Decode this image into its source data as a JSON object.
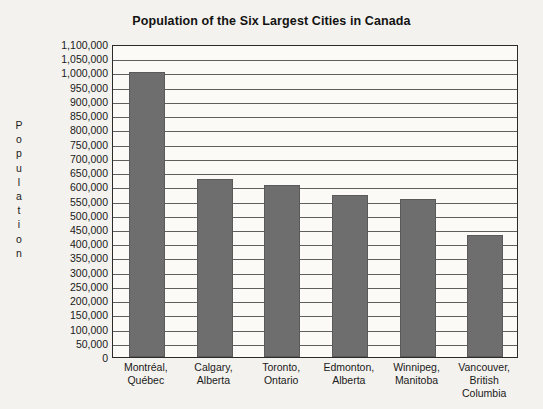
{
  "chart_data": {
    "type": "bar",
    "title": "Population of the Six Largest Cities in Canada",
    "xlabel": "",
    "ylabel": "Population",
    "ylabel_letters": [
      "P",
      "o",
      "p",
      "u",
      "l",
      "a",
      "t",
      "i",
      "o",
      "n"
    ],
    "categories": [
      "Montréal, Québec",
      "Calgary, Alberta",
      "Toronto, Ontario",
      "Edmonton, Alberta",
      "Winnipeg, Manitoba",
      "Vancouver, British Columbia"
    ],
    "category_lines": [
      [
        "Montréal,",
        "Québec"
      ],
      [
        "Calgary,",
        "Alberta"
      ],
      [
        "Toronto,",
        "Ontario"
      ],
      [
        "Edmonton,",
        "Alberta"
      ],
      [
        "Winnipeg,",
        "Manitoba"
      ],
      [
        "Vancouver,",
        "British",
        "Columbia"
      ]
    ],
    "values": [
      1000000,
      625000,
      605000,
      570000,
      555000,
      430000
    ],
    "ylim": [
      0,
      1100000
    ],
    "ytick_step": 50000,
    "ytick_labels": [
      "1,100,000",
      "1,050,000",
      "1,000,000",
      "950,000",
      "900,000",
      "850,000",
      "800,000",
      "750,000",
      "700,000",
      "650,000",
      "600,000",
      "550,000",
      "500,000",
      "450,000",
      "400,000",
      "350,000",
      "300,000",
      "250,000",
      "200,000",
      "150,000",
      "100,000",
      "50,000",
      "0"
    ],
    "ytick_values": [
      1100000,
      1050000,
      1000000,
      950000,
      900000,
      850000,
      800000,
      750000,
      700000,
      650000,
      600000,
      550000,
      500000,
      450000,
      400000,
      350000,
      300000,
      250000,
      200000,
      150000,
      100000,
      50000,
      0
    ],
    "grid": true,
    "legend": "none",
    "bar_color": "#6e6e6e",
    "plot_background": "#fbfaf7",
    "page_background": "#f4f2ee",
    "axis_color": "#2b2b2b",
    "grid_color": "#5f5f5f",
    "text_color": "#1a1a1a"
  }
}
